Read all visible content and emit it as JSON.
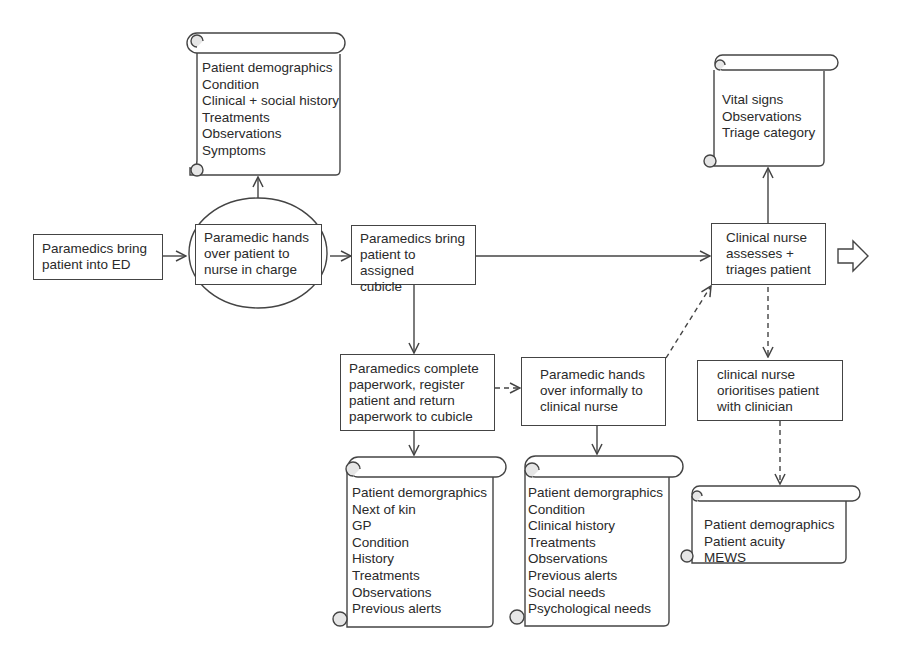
{
  "diagram": {
    "type": "process-flow",
    "nodes": {
      "bring_into_ed": {
        "label_lines": [
          "Paramedics bring",
          "patient into ED"
        ]
      },
      "handover_nic": {
        "label_lines": [
          "Paramedic hands",
          "over patient to",
          "nurse in charge"
        ],
        "highlight": "circle"
      },
      "bring_to_cubicle": {
        "label_lines": [
          "Paramedics bring",
          "patient to assigned",
          "cubicle"
        ]
      },
      "assess_triage": {
        "label_lines": [
          "Clinical nurse",
          "assesses +",
          "triages patient"
        ]
      },
      "complete_paperwork": {
        "label_lines": [
          "Paramedics complete",
          "paperwork, register",
          "patient and return",
          "paperwork to cubicle"
        ]
      },
      "informal_handover": {
        "label_lines": [
          "Paramedic hands",
          "over informally to",
          "clinical nurse"
        ]
      },
      "prioritise": {
        "label_lines": [
          "clinical nurse",
          "orioritises patient",
          "with clinician"
        ]
      }
    },
    "documents": {
      "handover_info": {
        "items": [
          "Patient demographics",
          "Condition",
          "Clinical + social history",
          "Treatments",
          "Observations",
          "Symptoms"
        ]
      },
      "triage_info": {
        "items": [
          "Vital signs",
          "Observations",
          "Triage category"
        ]
      },
      "paperwork_info": {
        "items": [
          "Patient demorgraphics",
          "Next of kin",
          "GP",
          "Condition",
          "History",
          "Treatments",
          "Observations",
          "Previous alerts"
        ]
      },
      "informal_info": {
        "items": [
          "Patient demorgraphics",
          "Condition",
          "Clinical history",
          "Treatments",
          "Observations",
          "Previous alerts",
          "Social needs",
          "Psychological needs"
        ]
      },
      "priority_info": {
        "items": [
          "Patient demographics",
          "Patient acuity",
          "MEWS"
        ]
      }
    },
    "edges": [
      {
        "from": "bring_into_ed",
        "to": "handover_nic",
        "style": "solid"
      },
      {
        "from": "handover_nic",
        "to": "bring_to_cubicle",
        "style": "solid"
      },
      {
        "from": "handover_nic",
        "to": "handover_info",
        "style": "solid"
      },
      {
        "from": "bring_to_cubicle",
        "to": "assess_triage",
        "style": "solid"
      },
      {
        "from": "bring_to_cubicle",
        "to": "complete_paperwork",
        "style": "solid"
      },
      {
        "from": "assess_triage",
        "to": "triage_info",
        "style": "solid"
      },
      {
        "from": "complete_paperwork",
        "to": "informal_handover",
        "style": "dashed"
      },
      {
        "from": "complete_paperwork",
        "to": "paperwork_info",
        "style": "solid"
      },
      {
        "from": "informal_handover",
        "to": "assess_triage",
        "style": "dashed"
      },
      {
        "from": "informal_handover",
        "to": "informal_info",
        "style": "solid"
      },
      {
        "from": "assess_triage",
        "to": "prioritise",
        "style": "dashed"
      },
      {
        "from": "prioritise",
        "to": "priority_info",
        "style": "dashed"
      }
    ],
    "continuation_arrow": "block-arrow-right",
    "colors": {
      "line": "#444444",
      "text": "#2a2a2a",
      "curl_fill": "#e6e6e6"
    }
  }
}
